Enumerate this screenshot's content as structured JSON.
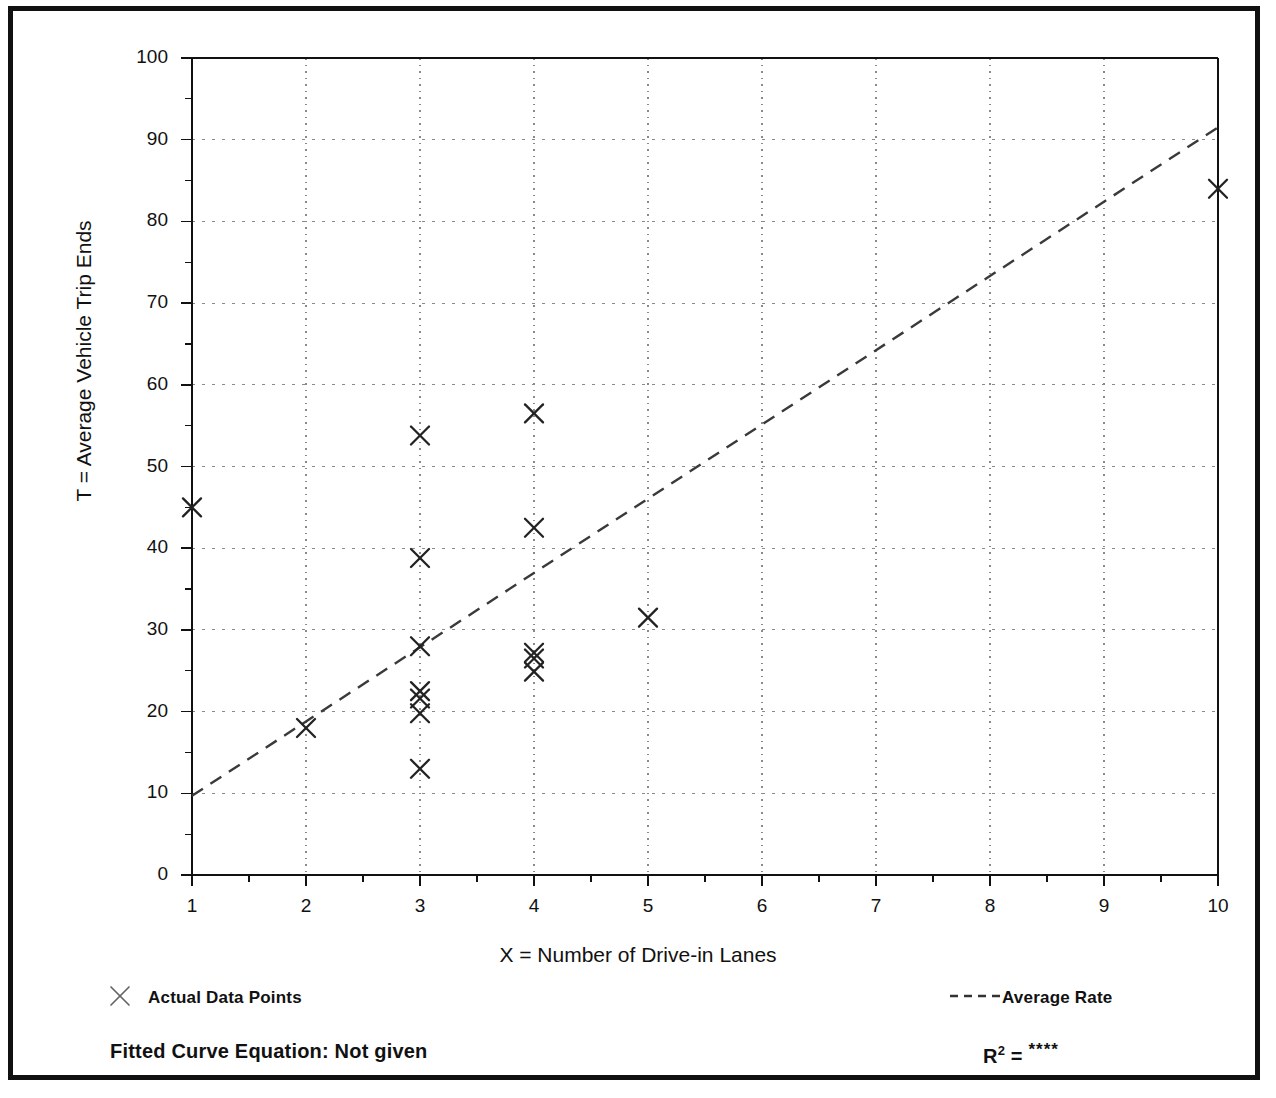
{
  "figure": {
    "x_axis_title": "X = Number of Drive-in Lanes",
    "y_axis_title": "T = Average Vehicle Trip Ends"
  },
  "legend": {
    "data_points_label": "Actual Data Points",
    "average_rate_label": "Average Rate",
    "marker_glyph": "×"
  },
  "footer": {
    "fitted_curve_label": "Fitted Curve Equation:  Not given",
    "r_squared_symbol": "R",
    "r_squared_exponent": "2",
    "r_squared_equals": " = ",
    "r_squared_value": "****"
  },
  "colors": {
    "ink": "#111111",
    "grid": "#8a8a8a",
    "trend_line": "#3a3a3a",
    "marker": "#222222",
    "frame": "#111111"
  },
  "chart_data": {
    "type": "scatter",
    "title": "",
    "xlabel": "X = Number of Drive-in Lanes",
    "ylabel": "T = Average Vehicle Trip Ends",
    "xlim": [
      1,
      10
    ],
    "ylim": [
      0,
      100
    ],
    "grid": true,
    "legend_position": "below-plot",
    "x_ticks": [
      1,
      2,
      3,
      4,
      5,
      6,
      7,
      8,
      9,
      10
    ],
    "x_tick_labels": [
      "1",
      "2",
      "3",
      "4",
      "5",
      "6",
      "7",
      "8",
      "9",
      "10"
    ],
    "x_minor_tick_step": 0.5,
    "y_ticks": [
      0,
      10,
      20,
      30,
      40,
      50,
      60,
      70,
      80,
      90,
      100
    ],
    "y_tick_labels": [
      "0",
      "10",
      "20",
      "30",
      "40",
      "50",
      "60",
      "70",
      "80",
      "90",
      "100"
    ],
    "y_minor_tick_step": 5,
    "series": [
      {
        "name": "Actual Data Points",
        "type": "scatter",
        "marker": "x",
        "points": [
          {
            "x": 1,
            "y": 45.0
          },
          {
            "x": 2,
            "y": 18.0
          },
          {
            "x": 3,
            "y": 53.8
          },
          {
            "x": 3,
            "y": 38.8
          },
          {
            "x": 3,
            "y": 28.0
          },
          {
            "x": 3,
            "y": 22.5
          },
          {
            "x": 3,
            "y": 21.6
          },
          {
            "x": 3,
            "y": 19.8
          },
          {
            "x": 3,
            "y": 13.0
          },
          {
            "x": 4,
            "y": 56.5
          },
          {
            "x": 4,
            "y": 42.5
          },
          {
            "x": 4,
            "y": 27.2
          },
          {
            "x": 4,
            "y": 26.5
          },
          {
            "x": 4,
            "y": 24.9
          },
          {
            "x": 5,
            "y": 31.5
          },
          {
            "x": 10,
            "y": 84.0
          }
        ]
      },
      {
        "name": "Average Rate",
        "type": "line",
        "style": "dashed",
        "points": [
          {
            "x": 1,
            "y": 9.7
          },
          {
            "x": 10,
            "y": 91.5
          }
        ]
      }
    ]
  }
}
